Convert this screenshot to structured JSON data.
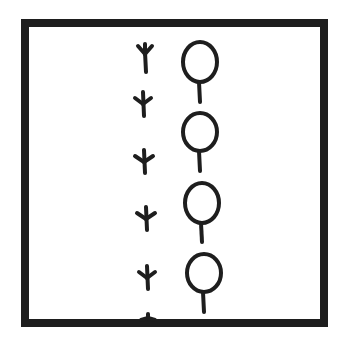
{
  "panel": {
    "description": "Hand-drawn panel: a trail of bird footprints beside a row of lollipop shapes",
    "border_color": "#1e1e1e",
    "background": "#ffffff",
    "stroke_color": "#1e1e1e"
  },
  "footprints": [
    {
      "x": 145,
      "y": 58,
      "orientation": "up"
    },
    {
      "x": 143,
      "y": 104,
      "orientation": "down"
    },
    {
      "x": 144,
      "y": 160,
      "orientation": "down"
    },
    {
      "x": 147,
      "y": 217,
      "orientation": "down"
    },
    {
      "x": 147,
      "y": 275,
      "orientation": "down"
    },
    {
      "x": 149,
      "y": 320,
      "orientation": "partial"
    }
  ],
  "lollipops": [
    {
      "cx": 200,
      "cy": 63,
      "r": 18,
      "stick_end": 102
    },
    {
      "cx": 200,
      "cy": 132,
      "r": 18,
      "stick_end": 170
    },
    {
      "cx": 202,
      "cy": 202,
      "r": 18,
      "stick_end": 240
    },
    {
      "cx": 204,
      "cy": 272,
      "r": 18,
      "stick_end": 312
    }
  ]
}
